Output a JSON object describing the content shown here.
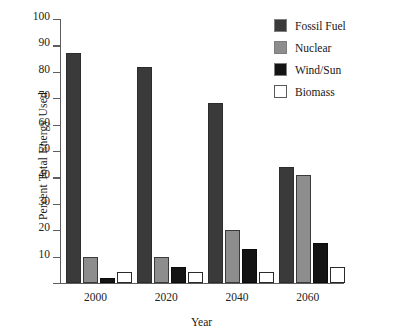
{
  "chart_data": {
    "type": "bar",
    "title": "",
    "xlabel": "Year",
    "ylabel": "Percent Total Energy Used",
    "categories": [
      "2000",
      "2020",
      "2040",
      "2060"
    ],
    "series": [
      {
        "name": "Fossil Fuel",
        "color": "#3a3a3a",
        "values": [
          87,
          82,
          68,
          44
        ]
      },
      {
        "name": "Nuclear",
        "color": "#8d8d8d",
        "values": [
          10,
          10,
          20,
          41
        ]
      },
      {
        "name": "Wind/Sun",
        "color": "#141414",
        "values": [
          2,
          6,
          13,
          15
        ]
      },
      {
        "name": "Biomass",
        "color": "#ffffff",
        "values": [
          4,
          4,
          4,
          6
        ]
      }
    ],
    "ylim": [
      0,
      100
    ],
    "yticks": [
      0,
      10,
      20,
      30,
      40,
      50,
      60,
      70,
      80,
      90,
      100
    ],
    "ytick_labels": [
      "",
      "10",
      "20",
      "30",
      "40",
      "50",
      "60",
      "70",
      "80",
      "90",
      "100"
    ],
    "grid": false,
    "legend_position": "top-right"
  },
  "legend": {
    "items": [
      {
        "label": "Fossil Fuel",
        "swatch": "fossil"
      },
      {
        "label": "Nuclear",
        "swatch": "nuclear"
      },
      {
        "label": "Wind/Sun",
        "swatch": "wind"
      },
      {
        "label": "Biomass",
        "swatch": "biomass"
      }
    ]
  }
}
